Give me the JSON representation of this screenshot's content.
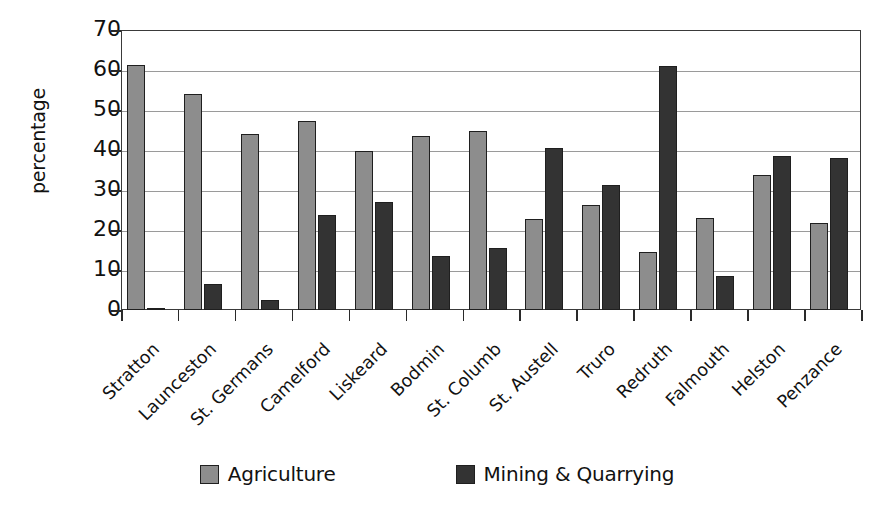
{
  "chart_data": {
    "type": "bar",
    "title": "",
    "subtitle": "",
    "xlabel": "",
    "ylabel": "percentage",
    "ylim": [
      0,
      70
    ],
    "yticks": [
      0,
      10,
      20,
      30,
      40,
      50,
      60,
      70
    ],
    "grid": true,
    "legend_position": "bottom",
    "categories": [
      "Stratton",
      "Launceston",
      "St. Germans",
      "Camelford",
      "Liskeard",
      "Bodmin",
      "St. Columb",
      "St. Austell",
      "Truro",
      "Redruth",
      "Falmouth",
      "Helston",
      "Penzance"
    ],
    "series": [
      {
        "name": "Agriculture",
        "color": "#8d8d8d",
        "values": [
          61.2,
          54.0,
          44.0,
          47.2,
          39.7,
          43.6,
          44.7,
          22.7,
          26.2,
          14.4,
          23.0,
          33.7,
          21.8
        ]
      },
      {
        "name": "Mining & Quarrying",
        "color": "#333333",
        "values": [
          0.4,
          6.6,
          2.6,
          23.8,
          26.9,
          13.5,
          15.6,
          40.6,
          31.2,
          61.0,
          8.4,
          38.4,
          37.9
        ]
      }
    ]
  },
  "legend": {
    "items": [
      {
        "label": "Agriculture",
        "color": "#8d8d8d"
      },
      {
        "label": "Mining & Quarrying",
        "color": "#333333"
      }
    ]
  },
  "axis": {
    "y_title": "percentage",
    "y_tick_labels": [
      "70",
      "60",
      "50",
      "40",
      "30",
      "20",
      "10",
      "0"
    ]
  }
}
